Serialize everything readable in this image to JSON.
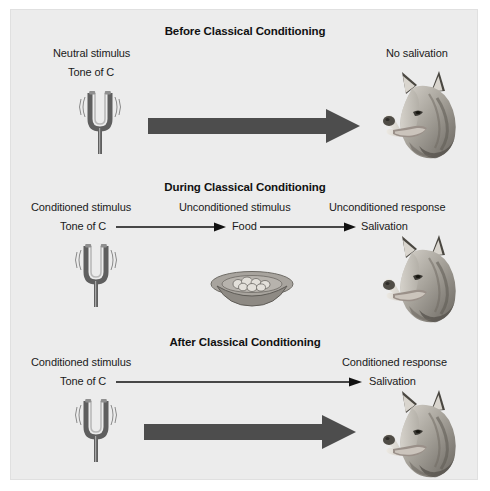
{
  "figure": {
    "background_color": "#ececec",
    "arrow_color": "#4d4d4d",
    "text_color": "#1a1a1a"
  },
  "panels": [
    {
      "id": "before",
      "heading": "Before Classical Conditioning",
      "left_label_top": "Neutral stimulus",
      "left_label_bottom": "Tone of C",
      "right_label_top": "No salivation",
      "icons": {
        "stimulus": "tuning-fork-icon",
        "connector": "thick-arrow-icon",
        "response": "dog-head-icon"
      }
    },
    {
      "id": "during",
      "heading": "During Classical Conditioning",
      "left_label_top": "Conditioned stimulus",
      "left_label_bottom": "Tone of C",
      "middle_label_top": "Unconditioned stimulus",
      "middle_label_bottom": "Food",
      "right_label_top": "Unconditioned response",
      "right_label_bottom": "Salivation",
      "icons": {
        "stimulus": "tuning-fork-icon",
        "unconditioned_stimulus": "food-bowl-icon",
        "connector_left": "thin-arrow-icon",
        "connector_right": "thin-arrow-icon",
        "response": "dog-head-icon"
      }
    },
    {
      "id": "after",
      "heading": "After Classical Conditioning",
      "left_label_top": "Conditioned stimulus",
      "left_label_bottom": "Tone of C",
      "right_label_top": "Conditioned response",
      "right_label_bottom": "Salivation",
      "icons": {
        "stimulus": "tuning-fork-icon",
        "connector_thin": "thin-arrow-icon",
        "connector_thick": "thick-arrow-icon",
        "response": "dog-head-icon"
      }
    }
  ]
}
